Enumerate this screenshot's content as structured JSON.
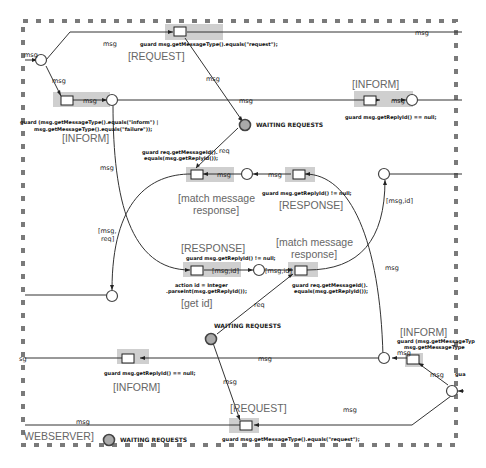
{
  "diagram": {
    "border_label": "WEBSERVER]",
    "places": {
      "waiting_requests_top": "WAITING REQUESTS",
      "waiting_requests_middle": "WAITING REQUESTS",
      "waiting_requests_bottom": "WAITING REQUESTS"
    },
    "transitions": {
      "request_top": {
        "title": "[REQUEST]",
        "guard": "guard msg.getMessageType().equals(\"request\");"
      },
      "inform_left": {
        "title": "[INFORM]",
        "guard_line1": "guard (msg.getMessageType().equals(\"inform\") |",
        "guard_line2": "msg.getMessageType().equals(\"failure\"));"
      },
      "inform_right_top": {
        "title": "[INFORM]",
        "guard": "guard msg.getReplyId() == null;"
      },
      "match_top": {
        "title_line1": "[match message",
        "title_line2": "response]",
        "guard_line1": "guard req.getMessageId().",
        "guard_line2": "equals(msg.getReplyId());"
      },
      "response_top": {
        "title": "[RESPONSE]",
        "guard": "guard msg.getReplyId() != null;"
      },
      "get_id": {
        "title": "[RESPONSE]",
        "guard": "guard msg.getReplyId() != null;",
        "action_line1": "action id = Integer",
        "action_line2": ".parseInt(msg.getReplyId());",
        "subtitle": "[get id]"
      },
      "match_bottom": {
        "title_line1": "[match message",
        "title_line2": "response]",
        "guard_line1": "guard req.getMessageId().",
        "guard_line2": "equals(msg.getReplyId());"
      },
      "inform_bottom_left": {
        "title": "[INFORM]",
        "guard": "guard msg.getReplyId() == null;"
      },
      "inform_bottom_right": {
        "title": "[INFORM]",
        "guard_line1": "guard (msg.getMessageTyp",
        "guard_line2": "msg.getMessageType"
      },
      "request_bottom": {
        "title": "[REQUEST]",
        "guard": "guard msg.getMessageType().equals(\"request\");"
      }
    },
    "arc_labels": {
      "msg": "msg",
      "req": "req",
      "msg_id": "[msg,id]",
      "msg_req_1": "[msg,",
      "msg_req_2": "req]",
      "sg": "sg",
      "gua": "gua"
    }
  }
}
